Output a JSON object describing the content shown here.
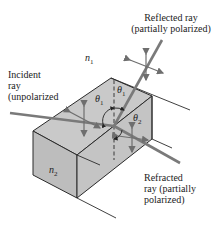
{
  "labels": {
    "reflected_line1": "Reflected ray",
    "reflected_line2": "(partially polarized)",
    "incident_line1": "Incident",
    "incident_line2": "ray",
    "incident_line3": "(unpolarized",
    "refracted_line1": "Refracted",
    "refracted_line2": "ray (partially",
    "refracted_line3": "polarized)"
  },
  "symbols": {
    "n1": "n",
    "n1_sub": "1",
    "n2": "n",
    "n2_sub": "2",
    "theta1_left": "θ",
    "theta1_left_sub": "1",
    "theta1_right": "θ",
    "theta1_right_sub": "1",
    "theta2": "θ",
    "theta2_sub": "2"
  },
  "colors": {
    "block_face": "#c8c8c8",
    "block_face_dark": "#bdbdbd",
    "ray": "#7a7a7a",
    "outline": "#2a2a2a",
    "arrows": "#6e6e6e"
  }
}
